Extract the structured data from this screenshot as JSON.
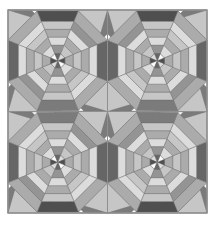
{
  "figure": {
    "name": "quilt-pattern",
    "width": 217,
    "height": 225,
    "background": "#ffffff",
    "frame": {
      "x": 8,
      "y": 10,
      "width": 199,
      "height": 203,
      "stroke": "#8f8f8f",
      "stroke_width": 1.2
    }
  },
  "palette": {
    "white": "#fbfbfb",
    "near_white": "#f2f2f2",
    "light": "#dcdcdc",
    "light_mid": "#c6c6c6",
    "mid": "#ababab",
    "mid_dark": "#949494",
    "dark": "#7b7b7b",
    "darker": "#666666",
    "darkest": "#4f4f4f",
    "outline": "#6e6e6e",
    "seam": "#8f8f8f"
  },
  "grid": {
    "columns": 2,
    "rows": 2,
    "cell_width": 99.5,
    "cell_height": 101.5,
    "origin_x": 8,
    "origin_y": 10,
    "seam_stroke": "#8f8f8f",
    "seam_width": 1.0
  },
  "block_template": {
    "description": "Octagon divided into 8 radial wedges; each wedge split into 6 concentric bands plus a center triangle.",
    "wedges": 8,
    "rings": 6,
    "octagon_radius": 0.5,
    "ring_radii": [
      0.07,
      0.155,
      0.235,
      0.315,
      0.395,
      0.5
    ],
    "corner_triangle_bands": 3
  },
  "blocks": [
    {
      "id": "block-top-left",
      "row": 0,
      "col": 0,
      "rotation": 0,
      "mirror": false,
      "center_triangles": [
        "darkest",
        "white",
        "darker",
        "light",
        "darkest",
        "white",
        "darker",
        "light"
      ],
      "wedge_rings": [
        [
          "darkest",
          "mid",
          "light_mid",
          "mid",
          "light",
          "darker"
        ],
        [
          "white",
          "light",
          "mid",
          "light_mid",
          "light",
          "mid"
        ],
        [
          "darker",
          "mid_dark",
          "light",
          "mid",
          "light_mid",
          "dark"
        ],
        [
          "light",
          "light_mid",
          "mid",
          "light",
          "mid_dark",
          "mid"
        ],
        [
          "darkest",
          "mid",
          "light_mid",
          "mid",
          "light",
          "darker"
        ],
        [
          "white",
          "light",
          "mid",
          "light_mid",
          "light",
          "mid"
        ],
        [
          "darker",
          "mid_dark",
          "light",
          "mid",
          "light_mid",
          "darkest"
        ],
        [
          "light",
          "light_mid",
          "mid",
          "light",
          "mid_dark",
          "mid"
        ]
      ],
      "corners": [
        {
          "position": "top-left",
          "bands": [
            "dark",
            "white",
            "light_mid"
          ]
        },
        {
          "position": "top-right",
          "bands": [
            "dark",
            "white",
            "light_mid"
          ]
        },
        {
          "position": "bottom-right",
          "bands": [
            "dark",
            "white",
            "light_mid"
          ]
        },
        {
          "position": "bottom-left",
          "bands": [
            "dark",
            "white",
            "light_mid"
          ]
        }
      ]
    },
    {
      "id": "block-top-right",
      "row": 0,
      "col": 1,
      "rotation": 0,
      "mirror": true,
      "center_triangles": [
        "darkest",
        "white",
        "darker",
        "light",
        "darkest",
        "white",
        "darker",
        "light"
      ],
      "wedge_rings": [
        [
          "darkest",
          "mid",
          "light_mid",
          "mid",
          "light",
          "darker"
        ],
        [
          "white",
          "light",
          "mid",
          "light_mid",
          "light",
          "mid"
        ],
        [
          "darker",
          "mid_dark",
          "light",
          "mid",
          "light_mid",
          "dark"
        ],
        [
          "light",
          "light_mid",
          "mid",
          "light",
          "mid_dark",
          "mid"
        ],
        [
          "darkest",
          "mid",
          "light_mid",
          "mid",
          "light",
          "darker"
        ],
        [
          "white",
          "light",
          "mid",
          "light_mid",
          "light",
          "mid"
        ],
        [
          "darker",
          "mid_dark",
          "light",
          "mid",
          "light_mid",
          "darkest"
        ],
        [
          "light",
          "light_mid",
          "mid",
          "light",
          "mid_dark",
          "mid"
        ]
      ],
      "corners": [
        {
          "position": "top-left",
          "bands": [
            "dark",
            "white",
            "light_mid"
          ]
        },
        {
          "position": "top-right",
          "bands": [
            "dark",
            "white",
            "light_mid"
          ]
        },
        {
          "position": "bottom-right",
          "bands": [
            "dark",
            "white",
            "light_mid"
          ]
        },
        {
          "position": "bottom-left",
          "bands": [
            "dark",
            "white",
            "light_mid"
          ]
        }
      ]
    },
    {
      "id": "block-bottom-left",
      "row": 1,
      "col": 0,
      "rotation": 180,
      "mirror": false,
      "center_triangles": [
        "darkest",
        "white",
        "darker",
        "light",
        "darkest",
        "white",
        "darker",
        "light"
      ],
      "wedge_rings": [
        [
          "darkest",
          "mid",
          "light_mid",
          "mid",
          "light",
          "darker"
        ],
        [
          "white",
          "light",
          "mid",
          "light_mid",
          "light",
          "mid"
        ],
        [
          "darker",
          "mid_dark",
          "light",
          "mid",
          "light_mid",
          "dark"
        ],
        [
          "light",
          "light_mid",
          "mid",
          "light",
          "mid_dark",
          "mid"
        ],
        [
          "darkest",
          "mid",
          "light_mid",
          "mid",
          "light",
          "darker"
        ],
        [
          "white",
          "light",
          "mid",
          "light_mid",
          "light",
          "mid"
        ],
        [
          "darker",
          "mid_dark",
          "light",
          "mid",
          "light_mid",
          "darkest"
        ],
        [
          "light",
          "light_mid",
          "mid",
          "light",
          "mid_dark",
          "mid"
        ]
      ],
      "corners": [
        {
          "position": "top-left",
          "bands": [
            "dark",
            "white",
            "light_mid"
          ]
        },
        {
          "position": "top-right",
          "bands": [
            "dark",
            "white",
            "light_mid"
          ]
        },
        {
          "position": "bottom-right",
          "bands": [
            "dark",
            "white",
            "light_mid"
          ]
        },
        {
          "position": "bottom-left",
          "bands": [
            "dark",
            "white",
            "light_mid"
          ]
        }
      ]
    },
    {
      "id": "block-bottom-right",
      "row": 1,
      "col": 1,
      "rotation": 180,
      "mirror": true,
      "center_triangles": [
        "darkest",
        "white",
        "darker",
        "light",
        "darkest",
        "white",
        "darker",
        "light"
      ],
      "wedge_rings": [
        [
          "darkest",
          "mid",
          "light_mid",
          "mid",
          "light",
          "darker"
        ],
        [
          "white",
          "light",
          "mid",
          "light_mid",
          "light",
          "mid"
        ],
        [
          "darker",
          "mid_dark",
          "light",
          "mid",
          "light_mid",
          "dark"
        ],
        [
          "light",
          "light_mid",
          "mid",
          "light",
          "mid_dark",
          "mid"
        ],
        [
          "darkest",
          "mid",
          "light_mid",
          "mid",
          "light",
          "darker"
        ],
        [
          "white",
          "light",
          "mid",
          "light_mid",
          "light",
          "mid"
        ],
        [
          "darker",
          "mid_dark",
          "light",
          "mid",
          "light_mid",
          "darkest"
        ],
        [
          "light",
          "light_mid",
          "mid",
          "light",
          "mid_dark",
          "mid"
        ]
      ],
      "corners": [
        {
          "position": "top-left",
          "bands": [
            "dark",
            "white",
            "light_mid"
          ]
        },
        {
          "position": "top-right",
          "bands": [
            "dark",
            "white",
            "light_mid"
          ]
        },
        {
          "position": "bottom-right",
          "bands": [
            "dark",
            "white",
            "light_mid"
          ]
        },
        {
          "position": "bottom-left",
          "bands": [
            "dark",
            "white",
            "light_mid"
          ]
        }
      ]
    }
  ]
}
